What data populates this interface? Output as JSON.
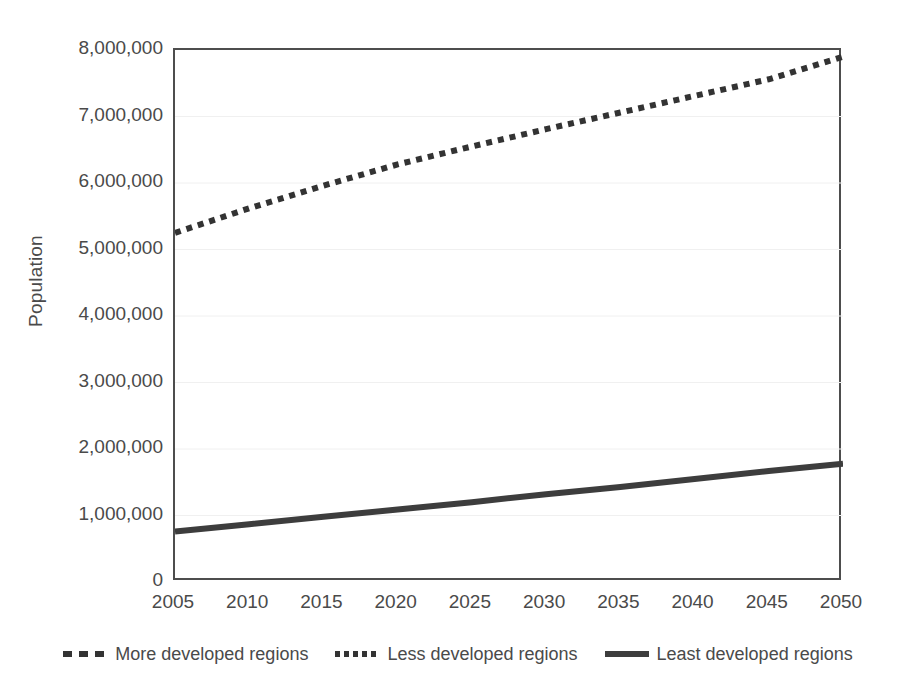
{
  "chart_data": {
    "type": "line",
    "title": "",
    "xlabel": "",
    "ylabel": "Population",
    "x": [
      2005,
      2010,
      2015,
      2020,
      2025,
      2030,
      2035,
      2040,
      2045,
      2050
    ],
    "xlim": [
      2005,
      2050
    ],
    "ylim": [
      0,
      8000000
    ],
    "grid": true,
    "legend_position": "bottom",
    "series": [
      {
        "name": "More developed regions",
        "style": "dashed",
        "color": "#333333",
        "values": [
          null,
          null,
          null,
          null,
          null,
          null,
          null,
          null,
          null,
          null
        ]
      },
      {
        "name": "Less developed regions",
        "style": "dotted",
        "color": "#333333",
        "values": [
          5250000,
          5620000,
          5960000,
          6280000,
          6550000,
          6810000,
          7060000,
          7310000,
          7560000,
          7900000
        ]
      },
      {
        "name": "Least developed regions",
        "style": "solid",
        "color": "#3d3d3d",
        "values": [
          760000,
          870000,
          980000,
          1090000,
          1200000,
          1320000,
          1430000,
          1550000,
          1670000,
          1780000
        ]
      }
    ]
  },
  "axes": {
    "y_title": "Population",
    "y_ticks": [
      {
        "value": 8000000,
        "label": "8,000,000"
      },
      {
        "value": 7000000,
        "label": "7,000,000"
      },
      {
        "value": 6000000,
        "label": "6,000,000"
      },
      {
        "value": 5000000,
        "label": "5,000,000"
      },
      {
        "value": 4000000,
        "label": "4,000,000"
      },
      {
        "value": 3000000,
        "label": "3,000,000"
      },
      {
        "value": 2000000,
        "label": "2,000,000"
      },
      {
        "value": 1000000,
        "label": "1,000,000"
      },
      {
        "value": 0,
        "label": "0"
      }
    ],
    "x_ticks": [
      {
        "value": 2005,
        "label": "2005"
      },
      {
        "value": 2010,
        "label": "2010"
      },
      {
        "value": 2015,
        "label": "2015"
      },
      {
        "value": 2020,
        "label": "2020"
      },
      {
        "value": 2025,
        "label": "2025"
      },
      {
        "value": 2030,
        "label": "2030"
      },
      {
        "value": 2035,
        "label": "2035"
      },
      {
        "value": 2040,
        "label": "2040"
      },
      {
        "value": 2045,
        "label": "2045"
      },
      {
        "value": 2050,
        "label": "2050"
      }
    ]
  },
  "legend": {
    "items": [
      {
        "label": "More developed regions",
        "style": "dashed",
        "color": "#333333"
      },
      {
        "label": "Less developed regions",
        "style": "dotted",
        "color": "#333333"
      },
      {
        "label": "Least developed regions",
        "style": "solid",
        "color": "#3d3d3d"
      }
    ]
  },
  "colors": {
    "background": "#ffffff",
    "axis": "#4d4d4d",
    "gridline": "#f0f0f0",
    "text": "#4a4a4a",
    "series": "#333333"
  }
}
